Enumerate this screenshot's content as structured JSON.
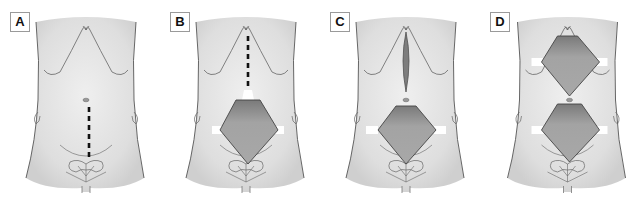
{
  "figure": {
    "panels": [
      {
        "label": "A",
        "description": "Torso with vertical dashed incision line below umbilicus"
      },
      {
        "label": "B",
        "description": "Lower diamond-shaped opening retracted with hooks, dashed line extending upward from opening"
      },
      {
        "label": "C",
        "description": "Upper vertical slit incision and lower diamond-shaped opening retracted"
      },
      {
        "label": "D",
        "description": "Two diamond-shaped openings retracted, upper and lower"
      }
    ],
    "colors": {
      "skin": "#e6e6e6",
      "outline": "#555555",
      "cavity": "#9e9e9e",
      "retractor": "#ffffff",
      "dash": "#111111"
    }
  }
}
